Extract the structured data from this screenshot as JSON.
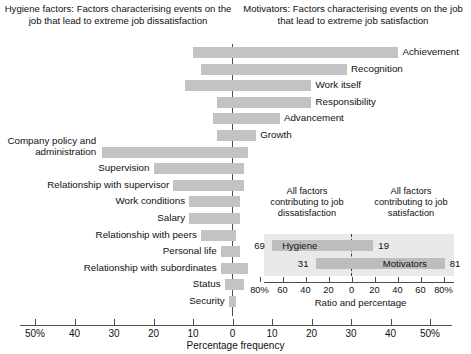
{
  "headings": {
    "hygiene": "Hygiene factors: Factors characterising events on the job that lead to extreme job dissatisfaction",
    "motivators": "Motivators: Factors characterising events on the job that lead to extreme job satisfaction"
  },
  "axis": {
    "title": "Percentage frequency",
    "tick_labels": [
      "50%",
      "40",
      "30",
      "20",
      "10",
      "0",
      "10",
      "20",
      "30",
      "40",
      "50%"
    ],
    "tick_values": [
      -50,
      -40,
      -30,
      -20,
      -10,
      0,
      10,
      20,
      30,
      40,
      50
    ]
  },
  "inset": {
    "heading_left": "All factors contributing to job dissatisfaction",
    "heading_right": "All factors contributing to job satisfaction",
    "axis_title": "Ratio and percentage",
    "tick_labels": [
      "80%",
      "60",
      "40",
      "20",
      "0",
      "20",
      "40",
      "60",
      "80%"
    ],
    "tick_values": [
      -80,
      -60,
      -40,
      -20,
      0,
      20,
      40,
      60,
      80
    ],
    "rows": [
      {
        "label": "Hygiene",
        "left_value": 69,
        "right_value": 19,
        "left_text": "69",
        "right_text": "19"
      },
      {
        "label": "Motivators",
        "left_value": 31,
        "right_value": 81,
        "left_text": "31",
        "right_text": "81"
      }
    ]
  },
  "chart_data": {
    "type": "bar",
    "xlabel": "Percentage frequency",
    "ylabel": "",
    "xlim": [
      -50,
      50
    ],
    "grid": false,
    "orientation": "horizontal-diverging",
    "bar_color": "#c3c3c3",
    "note": "Each bar spans from a negative (dissatisfaction) percentage to a positive (satisfaction) percentage about the zero centre line.",
    "categories": [
      "Achievement",
      "Recognition",
      "Work itself",
      "Responsibility",
      "Advancement",
      "Growth",
      "Company policy and administration",
      "Supervision",
      "Relationship with supervisor",
      "Work conditions",
      "Salary",
      "Relationship with peers",
      "Personal life",
      "Relationship with subordinates",
      "Status",
      "Security"
    ],
    "series": [
      {
        "name": "Dissatisfaction (left of zero)",
        "values": [
          -10,
          -8,
          -12,
          -4,
          -5,
          -4,
          -33,
          -20,
          -15,
          -11,
          -11,
          -8,
          -3,
          -3,
          -2,
          -1
        ]
      },
      {
        "name": "Satisfaction (right of zero)",
        "values": [
          42,
          29,
          20,
          20,
          12,
          6,
          4,
          3,
          3,
          2,
          2,
          1,
          2,
          4,
          3,
          1
        ]
      }
    ],
    "bars": [
      {
        "label": "Achievement",
        "left": -10,
        "right": 42,
        "side": "right"
      },
      {
        "label": "Recognition",
        "left": -8,
        "right": 29,
        "side": "right"
      },
      {
        "label": "Work itself",
        "left": -12,
        "right": 20,
        "side": "right"
      },
      {
        "label": "Responsibility",
        "left": -4,
        "right": 20,
        "side": "right"
      },
      {
        "label": "Advancement",
        "left": -5,
        "right": 12,
        "side": "right"
      },
      {
        "label": "Growth",
        "left": -4,
        "right": 6,
        "side": "right"
      },
      {
        "label": "Company policy and administration",
        "left": -33,
        "right": 4,
        "side": "left",
        "multiline": true
      },
      {
        "label": "Supervision",
        "left": -20,
        "right": 3,
        "side": "left"
      },
      {
        "label": "Relationship with supervisor",
        "left": -15,
        "right": 3,
        "side": "left"
      },
      {
        "label": "Work conditions",
        "left": -11,
        "right": 2,
        "side": "left"
      },
      {
        "label": "Salary",
        "left": -11,
        "right": 2,
        "side": "left"
      },
      {
        "label": "Relationship with peers",
        "left": -8,
        "right": 1,
        "side": "left"
      },
      {
        "label": "Personal life",
        "left": -3,
        "right": 2,
        "side": "left"
      },
      {
        "label": "Relationship with subordinates",
        "left": -3,
        "right": 4,
        "side": "left"
      },
      {
        "label": "Status",
        "left": -2,
        "right": 3,
        "side": "left"
      },
      {
        "label": "Security",
        "left": -1,
        "right": 1,
        "side": "left"
      }
    ],
    "inset_chart": {
      "type": "bar",
      "title": "Ratio and percentage",
      "xlim": [
        -80,
        80
      ],
      "categories": [
        "Hygiene",
        "Motivators"
      ],
      "series": [
        {
          "name": "Contributing to job dissatisfaction",
          "values": [
            69,
            31
          ]
        },
        {
          "name": "Contributing to job satisfaction",
          "values": [
            19,
            81
          ]
        }
      ]
    }
  }
}
